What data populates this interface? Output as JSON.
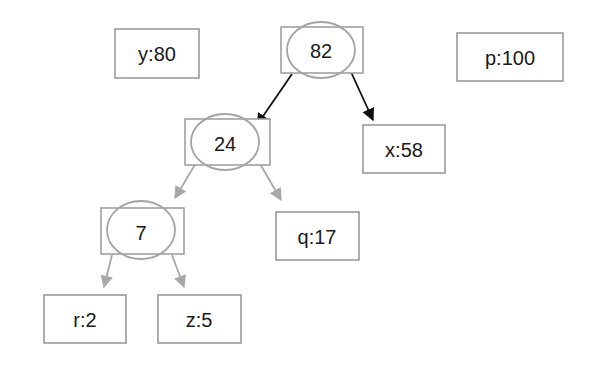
{
  "diagram": {
    "title": "",
    "leaves": [
      {
        "id": "y",
        "label": "y:80",
        "x": 115,
        "y": 29,
        "w": 84,
        "h": 49
      },
      {
        "id": "p",
        "label": "p:100",
        "x": 457,
        "y": 33,
        "w": 106,
        "h": 48
      },
      {
        "id": "x",
        "label": "x:58",
        "x": 363,
        "y": 125,
        "w": 82,
        "h": 48
      },
      {
        "id": "q",
        "label": "q:17",
        "x": 276,
        "y": 212,
        "w": 83,
        "h": 48
      },
      {
        "id": "r",
        "label": "r:2",
        "x": 44,
        "y": 295,
        "w": 82,
        "h": 48
      },
      {
        "id": "z",
        "label": "z:5",
        "x": 158,
        "y": 295,
        "w": 83,
        "h": 48
      }
    ],
    "internal_nodes": [
      {
        "id": "n82",
        "label": "82",
        "x": 281,
        "y": 27,
        "w": 82,
        "h": 46,
        "cx": 321,
        "cy": 50,
        "rx": 34,
        "ry": 28
      },
      {
        "id": "n24",
        "label": "24",
        "x": 185,
        "y": 119,
        "w": 85,
        "h": 46,
        "cx": 225,
        "cy": 142,
        "rx": 34,
        "ry": 28
      },
      {
        "id": "n7",
        "label": "7",
        "x": 101,
        "y": 208,
        "w": 83,
        "h": 46,
        "cx": 141,
        "cy": 230,
        "rx": 34,
        "ry": 29
      }
    ],
    "edges": [
      {
        "from": "82",
        "to": "24",
        "color": "#111111",
        "x1": 292,
        "y1": 74,
        "x2": 257,
        "y2": 125
      },
      {
        "from": "82",
        "to": "x:58",
        "color": "#111111",
        "x1": 351,
        "y1": 72,
        "x2": 373,
        "y2": 120
      },
      {
        "from": "24",
        "to": "7",
        "color": "#a8a8a8",
        "x1": 196,
        "y1": 163,
        "x2": 175,
        "y2": 198
      },
      {
        "from": "24",
        "to": "q:17",
        "color": "#a8a8a8",
        "x1": 259,
        "y1": 162,
        "x2": 281,
        "y2": 200
      },
      {
        "from": "7",
        "to": "r:2",
        "color": "#a8a8a8",
        "x1": 112,
        "y1": 255,
        "x2": 104,
        "y2": 287
      },
      {
        "from": "7",
        "to": "z:5",
        "color": "#a8a8a8",
        "x1": 172,
        "y1": 255,
        "x2": 184,
        "y2": 287
      }
    ],
    "colors": {
      "box_border": "#9a9a9a",
      "ellipse_border": "#a4a4a4",
      "active_edge": "#111111",
      "inactive_edge": "#a8a8a8",
      "text": "#1a1a1a"
    }
  }
}
